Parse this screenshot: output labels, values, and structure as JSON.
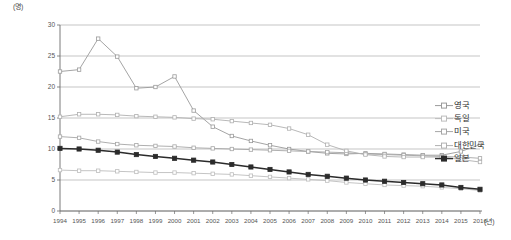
{
  "chart_data": {
    "type": "line",
    "title": "",
    "xlabel": "(년)",
    "ylabel": "(명)",
    "y_unit_label": "(명)",
    "x_unit_label": "(년)",
    "grid": true,
    "legend_position": "right",
    "ylim": [
      0,
      30
    ],
    "yticks": [
      0,
      5,
      10,
      15,
      20,
      25,
      30
    ],
    "categories": [
      1994,
      1995,
      1996,
      1997,
      1998,
      1999,
      2000,
      2001,
      2002,
      2003,
      2004,
      2005,
      2006,
      2007,
      2008,
      2009,
      2010,
      2011,
      2012,
      2013,
      2014,
      2015,
      2016
    ],
    "series": [
      {
        "name": "영국",
        "color": "#9a9a9a",
        "marker": "square",
        "values": [
          22.5,
          22.8,
          27.8,
          24.9,
          19.8,
          20.0,
          21.7,
          16.2,
          13.6,
          12.1,
          11.3,
          10.6,
          10.0,
          9.6,
          9.3,
          9.2,
          9.3,
          9.2,
          9.1,
          9.0,
          9.0,
          9.6,
          10.7
        ]
      },
      {
        "name": "독일",
        "color": "#bdbdbd",
        "marker": "square",
        "values": [
          6.6,
          6.5,
          6.5,
          6.4,
          6.3,
          6.2,
          6.2,
          6.1,
          6.0,
          5.9,
          5.7,
          5.5,
          5.3,
          5.1,
          4.9,
          4.6,
          4.4,
          4.2,
          4.1,
          4.0,
          3.8,
          3.6,
          3.3
        ]
      },
      {
        "name": "미국",
        "color": "#a6a6a6",
        "marker": "square",
        "values": [
          12.0,
          11.8,
          11.2,
          10.8,
          10.6,
          10.5,
          10.4,
          10.2,
          10.1,
          10.0,
          9.9,
          9.8,
          9.7,
          9.6,
          9.5,
          9.4,
          9.2,
          9.1,
          9.0,
          8.9,
          8.8,
          8.7,
          8.5
        ]
      },
      {
        "name": "대한민국",
        "color": "#b0b0b0",
        "marker": "square",
        "values": [
          15.2,
          15.6,
          15.6,
          15.5,
          15.3,
          15.2,
          15.1,
          14.9,
          14.8,
          14.5,
          14.2,
          13.9,
          13.3,
          12.3,
          10.7,
          9.7,
          9.1,
          8.8,
          8.7,
          8.7,
          8.7,
          8.3,
          7.9
        ]
      },
      {
        "name": "일본",
        "color": "#2b2b2b",
        "marker": "square-filled",
        "values": [
          10.1,
          10.0,
          9.8,
          9.5,
          9.1,
          8.8,
          8.5,
          8.2,
          7.9,
          7.5,
          7.1,
          6.7,
          6.3,
          5.9,
          5.6,
          5.3,
          5.0,
          4.8,
          4.6,
          4.4,
          4.2,
          3.8,
          3.5
        ]
      }
    ]
  },
  "legend": {
    "items": [
      {
        "label": "영국"
      },
      {
        "label": "독일"
      },
      {
        "label": "미국"
      },
      {
        "label": "대한민국"
      },
      {
        "label": "일본"
      }
    ]
  }
}
